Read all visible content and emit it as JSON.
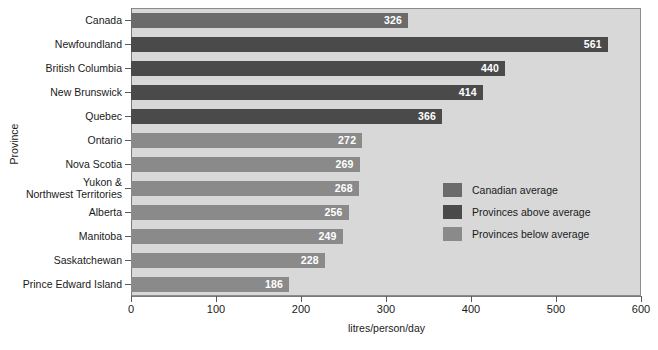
{
  "chart_data": {
    "type": "bar",
    "orientation": "horizontal",
    "title": "",
    "xlabel": "litres/person/day",
    "ylabel": "Province",
    "xlim": [
      0,
      600
    ],
    "xticks": [
      0,
      100,
      200,
      300,
      400,
      500,
      600
    ],
    "grid": false,
    "legend_position": "center-right",
    "categories": [
      "Canada",
      "Newfoundland",
      "British Columbia",
      "New Brunswick",
      "Quebec",
      "Ontario",
      "Nova Scotia",
      "Yukon &\nNorthwest Territories",
      "Alberta",
      "Manitoba",
      "Saskatchewan",
      "Prince Edward Island"
    ],
    "values": [
      326,
      561,
      440,
      414,
      366,
      272,
      269,
      268,
      256,
      249,
      228,
      186
    ],
    "bars": [
      {
        "category": "Canada",
        "label_line1": "Canada",
        "label_line2": "",
        "value": 326,
        "series": "Canadian average"
      },
      {
        "category": "Newfoundland",
        "label_line1": "Newfoundland",
        "label_line2": "",
        "value": 561,
        "series": "Provinces above average"
      },
      {
        "category": "British Columbia",
        "label_line1": "British Columbia",
        "label_line2": "",
        "value": 440,
        "series": "Provinces above average"
      },
      {
        "category": "New Brunswick",
        "label_line1": "New Brunswick",
        "label_line2": "",
        "value": 414,
        "series": "Provinces above average"
      },
      {
        "category": "Quebec",
        "label_line1": "Quebec",
        "label_line2": "",
        "value": 366,
        "series": "Provinces above average"
      },
      {
        "category": "Ontario",
        "label_line1": "Ontario",
        "label_line2": "",
        "value": 272,
        "series": "Provinces below average"
      },
      {
        "category": "Nova Scotia",
        "label_line1": "Nova Scotia",
        "label_line2": "",
        "value": 269,
        "series": "Provinces below average"
      },
      {
        "category": "Yukon & Northwest Territories",
        "label_line1": "Yukon &",
        "label_line2": "Northwest Territories",
        "value": 268,
        "series": "Provinces below average"
      },
      {
        "category": "Alberta",
        "label_line1": "Alberta",
        "label_line2": "",
        "value": 256,
        "series": "Provinces below average"
      },
      {
        "category": "Manitoba",
        "label_line1": "Manitoba",
        "label_line2": "",
        "value": 249,
        "series": "Provinces below average"
      },
      {
        "category": "Saskatchewan",
        "label_line1": "Saskatchewan",
        "label_line2": "",
        "value": 228,
        "series": "Provinces below average"
      },
      {
        "category": "Prince Edward Island",
        "label_line1": "Prince Edward Island",
        "label_line2": "",
        "value": 186,
        "series": "Provinces below average"
      }
    ],
    "series": [
      {
        "name": "Canadian average",
        "color": "#6b6b6b"
      },
      {
        "name": "Provinces above average",
        "color": "#4a4a4a"
      },
      {
        "name": "Provinces below average",
        "color": "#8a8a8a"
      }
    ],
    "legend": [
      {
        "label": "Canadian average",
        "color": "#6b6b6b"
      },
      {
        "label": "Provinces above average",
        "color": "#4a4a4a"
      },
      {
        "label": "Provinces below average",
        "color": "#8a8a8a"
      }
    ],
    "colors": {
      "plot_background": "#d8d8d8",
      "page_background": "#ffffff",
      "axis": "#7a7a7a",
      "value_label": "#ffffff",
      "text": "#1a1a1a"
    }
  }
}
